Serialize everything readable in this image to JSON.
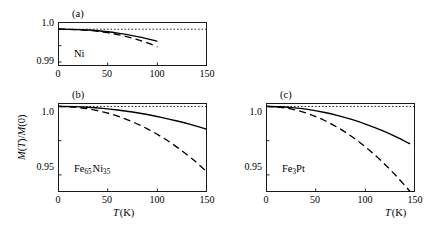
{
  "figure": {
    "y_axis_title": "M(T)/M(0)",
    "x_axis_title": "T (K)"
  },
  "chart_data": [
    {
      "type": "line",
      "panel": "a",
      "panel_tag": "(a)",
      "title": "Ni",
      "material_label": "Ni",
      "xlabel": "T (K)",
      "ylabel": "M(T)/M(0)",
      "xlim": [
        0,
        150
      ],
      "ylim": [
        0.9888,
        1.0022
      ],
      "xticks": [
        0,
        50,
        100,
        150
      ],
      "xticklabels": [
        "0",
        "50",
        "100",
        "150"
      ],
      "yticks": [
        0.99,
        0.995,
        1.0
      ],
      "yticklabels": [
        "0.99",
        "",
        "1.0"
      ],
      "grid": false,
      "legend": "none",
      "reference_line": {
        "style": "dotted",
        "y": 1.0
      },
      "series": [
        {
          "name": "solid",
          "style": "solid",
          "x": [
            0,
            10,
            20,
            30,
            40,
            50,
            60,
            70,
            80,
            90,
            100
          ],
          "values": [
            1.0,
            0.99997,
            0.99989,
            0.99975,
            0.99953,
            0.99922,
            0.99882,
            0.99833,
            0.99775,
            0.99708,
            0.99632
          ]
        },
        {
          "name": "dashed",
          "style": "dashed",
          "x": [
            0,
            10,
            20,
            30,
            40,
            50,
            60,
            70,
            80,
            90,
            100
          ],
          "values": [
            1.0,
            0.99996,
            0.99985,
            0.99966,
            0.99936,
            0.99894,
            0.99838,
            0.99768,
            0.99683,
            0.99583,
            0.99466
          ]
        }
      ]
    },
    {
      "type": "line",
      "panel": "b",
      "panel_tag": "(b)",
      "title": "Fe65Ni35",
      "material_label": "Fe65Ni35",
      "xlabel": "T (K)",
      "ylabel": "M(T)/M(0)",
      "xlim": [
        0,
        150
      ],
      "ylim": [
        0.9375,
        1.0025
      ],
      "xticks": [
        0,
        50,
        100,
        150
      ],
      "xticklabels": [
        "0",
        "50",
        "100",
        "150"
      ],
      "yticks": [
        0.95,
        0.975,
        1.0
      ],
      "yticklabels": [
        "0.95",
        "",
        "1.0"
      ],
      "grid": false,
      "legend": "none",
      "reference_line": {
        "style": "dotted",
        "y": 1.0
      },
      "series": [
        {
          "name": "solid",
          "style": "solid",
          "x": [
            0,
            15,
            30,
            45,
            60,
            75,
            90,
            105,
            120,
            135,
            150
          ],
          "values": [
            1.0,
            0.99985,
            0.99938,
            0.99858,
            0.99742,
            0.99592,
            0.99408,
            0.99188,
            0.98935,
            0.98647,
            0.98325
          ]
        },
        {
          "name": "dashed",
          "style": "dashed",
          "x": [
            0,
            15,
            30,
            45,
            60,
            75,
            90,
            105,
            120,
            135,
            150
          ],
          "values": [
            1.0,
            0.99958,
            0.99828,
            0.99608,
            0.99292,
            0.98878,
            0.98362,
            0.97742,
            0.97012,
            0.96172,
            0.95218
          ]
        }
      ]
    },
    {
      "type": "line",
      "panel": "c",
      "panel_tag": "(c)",
      "title": "Fe3Pt",
      "material_label": "Fe3Pt",
      "xlabel": "T (K)",
      "ylabel": "M(T)/M(0)",
      "xlim": [
        0,
        150
      ],
      "ylim": [
        0.9375,
        1.0025
      ],
      "xticks": [
        0,
        50,
        100,
        150
      ],
      "xticklabels": [
        "0",
        "50",
        "100",
        "150"
      ],
      "yticks": [
        0.95,
        0.975,
        1.0
      ],
      "yticklabels": [
        "0.95",
        "",
        "1.0"
      ],
      "grid": false,
      "legend": "none",
      "reference_line": {
        "style": "dotted",
        "y": 1.0
      },
      "series": [
        {
          "name": "solid",
          "style": "solid",
          "x": [
            0,
            14.5,
            29,
            43.5,
            58,
            72.5,
            87,
            101.5,
            116,
            130.5,
            145
          ],
          "values": [
            1.0,
            0.99975,
            0.99895,
            0.99762,
            0.99572,
            0.99328,
            0.99028,
            0.98672,
            0.98262,
            0.97795,
            0.97272
          ]
        },
        {
          "name": "dashed",
          "style": "dashed",
          "x": [
            0,
            14.5,
            29,
            43.5,
            58,
            72.5,
            87,
            101.5,
            116,
            130.5,
            145
          ],
          "values": [
            1.0,
            0.99938,
            0.99752,
            0.99442,
            0.99008,
            0.98448,
            0.97765,
            0.96958,
            0.96025,
            0.94968,
            0.93788
          ]
        }
      ]
    }
  ]
}
